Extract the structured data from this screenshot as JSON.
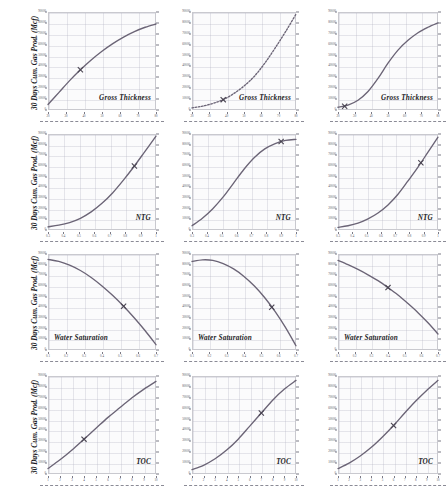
{
  "figure": {
    "shared_ylabel": "30 Days Cum. Gas Prod. (Mcf)",
    "rows": 4,
    "cols": 3,
    "curve_color": "#6b6476",
    "grid_color": "#b0b0c0",
    "marker": "x"
  },
  "chart_data": [
    {
      "id": "r1c1",
      "type": "line",
      "title": "",
      "xlabel": "Gross Thickness",
      "ylabel": "30 Days Cum. Gas Prod. (Mcf)",
      "annotation": "Gross Thickness",
      "shape": "concave-increasing",
      "grid": true,
      "xlim": [
        20,
        80
      ],
      "ylim": [
        0,
        90000
      ],
      "xticks": [
        20,
        30,
        40,
        50,
        60,
        70,
        80
      ],
      "yticks": [
        0,
        10000,
        20000,
        30000,
        40000,
        50000,
        60000,
        70000,
        80000,
        90000
      ],
      "xtick_labels": [
        "20",
        "30",
        "40",
        "50",
        "60",
        "70",
        "80"
      ],
      "ytick_labels": [
        "0",
        "10000",
        "20000",
        "30000",
        "40000",
        "50000",
        "60000",
        "70000",
        "80000",
        "90000"
      ],
      "x": [
        20,
        26,
        32,
        38,
        44,
        50,
        56,
        62,
        68,
        74,
        80
      ],
      "y": [
        5000,
        16000,
        27000,
        37000,
        46000,
        54000,
        61000,
        67000,
        72000,
        76000,
        79000
      ],
      "marker_point": [
        38,
        37000
      ]
    },
    {
      "id": "r1c2",
      "type": "line",
      "xlabel": "Gross Thickness",
      "ylabel": "30 Days Cum. Gas Prod. (Mcf)",
      "annotation": "Gross Thickness",
      "shape": "convex-increasing",
      "grid": true,
      "linestyle": "dotted",
      "xlim": [
        20,
        80
      ],
      "ylim": [
        0,
        90000
      ],
      "xticks": [
        20,
        30,
        40,
        50,
        60,
        70,
        80
      ],
      "yticks": [
        0,
        10000,
        20000,
        30000,
        40000,
        50000,
        60000,
        70000,
        80000,
        90000
      ],
      "xtick_labels": [
        "20",
        "30",
        "40",
        "50",
        "60",
        "70",
        "80"
      ],
      "ytick_labels": [
        "0",
        "10000",
        "20000",
        "30000",
        "40000",
        "50000",
        "60000",
        "70000",
        "80000",
        "90000"
      ],
      "x": [
        20,
        26,
        32,
        38,
        44,
        50,
        56,
        62,
        68,
        74,
        80
      ],
      "y": [
        2000,
        3500,
        6000,
        9500,
        15000,
        22000,
        31000,
        43000,
        57000,
        72000,
        88000
      ],
      "marker_point": [
        38,
        9500
      ]
    },
    {
      "id": "r1c3",
      "type": "line",
      "xlabel": "Gross Thickness",
      "ylabel": "30 Days Cum. Gas Prod. (Mcf)",
      "annotation": "Gross Thickness",
      "shape": "sigmoid-increasing",
      "grid": true,
      "xlim": [
        20,
        80
      ],
      "ylim": [
        0,
        90000
      ],
      "xticks": [
        20,
        30,
        40,
        50,
        60,
        70,
        80
      ],
      "yticks": [
        0,
        10000,
        20000,
        30000,
        40000,
        50000,
        60000,
        70000,
        80000,
        90000
      ],
      "xtick_labels": [
        "20",
        "30",
        "40",
        "50",
        "60",
        "70",
        "80"
      ],
      "ytick_labels": [
        "0",
        "10000",
        "20000",
        "30000",
        "40000",
        "50000",
        "60000",
        "70000",
        "80000",
        "90000"
      ],
      "x": [
        20,
        26,
        32,
        38,
        44,
        50,
        56,
        62,
        68,
        74,
        80
      ],
      "y": [
        2500,
        4500,
        9000,
        17000,
        29000,
        43000,
        55000,
        64000,
        71000,
        76000,
        80000
      ],
      "marker_point": [
        24,
        3500
      ]
    },
    {
      "id": "r2c1",
      "type": "line",
      "xlabel": "NTG",
      "ylabel": "30 Days Cum. Gas Prod. (Mcf)",
      "annotation": "NTG",
      "shape": "convex-increasing",
      "grid": true,
      "xlim": [
        0.3,
        1.0
      ],
      "ylim": [
        0,
        90000
      ],
      "xticks": [
        0.3,
        0.4,
        0.5,
        0.6,
        0.7,
        0.8,
        0.9,
        1.0
      ],
      "yticks": [
        0,
        10000,
        20000,
        30000,
        40000,
        50000,
        60000,
        70000,
        80000,
        90000
      ],
      "xtick_labels": [
        "0.3",
        "0.4",
        "0.5",
        "0.6",
        "0.7",
        "0.8",
        "0.9",
        "1"
      ],
      "ytick_labels": [
        "0",
        "10000",
        "20000",
        "30000",
        "40000",
        "50000",
        "60000",
        "70000",
        "80000",
        "90000"
      ],
      "x": [
        0.3,
        0.37,
        0.44,
        0.51,
        0.58,
        0.65,
        0.72,
        0.79,
        0.86,
        0.93,
        1.0
      ],
      "y": [
        3000,
        4500,
        7000,
        11000,
        17000,
        25000,
        35000,
        47000,
        60000,
        74000,
        88000
      ],
      "marker_point": [
        0.86,
        60000
      ]
    },
    {
      "id": "r2c2",
      "type": "line",
      "xlabel": "NTG",
      "ylabel": "30 Days Cum. Gas Prod. (Mcf)",
      "annotation": "NTG",
      "shape": "sigmoid-saturating",
      "grid": true,
      "xlim": [
        0.3,
        1.0
      ],
      "ylim": [
        0,
        90000
      ],
      "xticks": [
        0.3,
        0.4,
        0.5,
        0.6,
        0.7,
        0.8,
        0.9,
        1.0
      ],
      "yticks": [
        0,
        10000,
        20000,
        30000,
        40000,
        50000,
        60000,
        70000,
        80000,
        90000
      ],
      "xtick_labels": [
        "0.3",
        "0.4",
        "0.5",
        "0.6",
        "0.7",
        "0.8",
        "0.9",
        "1"
      ],
      "ytick_labels": [
        "0",
        "10000",
        "20000",
        "30000",
        "40000",
        "50000",
        "60000",
        "70000",
        "80000",
        "90000"
      ],
      "x": [
        0.3,
        0.37,
        0.44,
        0.51,
        0.58,
        0.65,
        0.72,
        0.79,
        0.86,
        0.93,
        1.0
      ],
      "y": [
        4000,
        11000,
        20000,
        31000,
        44000,
        57000,
        68000,
        76000,
        81000,
        84000,
        85000
      ],
      "marker_point": [
        0.9,
        83000
      ]
    },
    {
      "id": "r2c3",
      "type": "line",
      "xlabel": "NTG",
      "ylabel": "30 Days Cum. Gas Prod. (Mcf)",
      "annotation": "NTG",
      "shape": "convex-increasing",
      "grid": true,
      "xlim": [
        0.3,
        1.0
      ],
      "ylim": [
        0,
        90000
      ],
      "xticks": [
        0.3,
        0.4,
        0.5,
        0.6,
        0.7,
        0.8,
        0.9,
        1.0
      ],
      "yticks": [
        0,
        10000,
        20000,
        30000,
        40000,
        50000,
        60000,
        70000,
        80000,
        90000
      ],
      "xtick_labels": [
        "0.3",
        "0.4",
        "0.5",
        "0.6",
        "0.7",
        "0.8",
        "0.9",
        "1"
      ],
      "ytick_labels": [
        "0",
        "10000",
        "20000",
        "30000",
        "40000",
        "50000",
        "60000",
        "70000",
        "80000",
        "90000"
      ],
      "x": [
        0.3,
        0.37,
        0.44,
        0.51,
        0.58,
        0.65,
        0.72,
        0.79,
        0.86,
        0.93,
        1.0
      ],
      "y": [
        2500,
        4000,
        6500,
        10500,
        16000,
        23500,
        33500,
        46000,
        59000,
        73000,
        87000
      ],
      "marker_point": [
        0.88,
        63000
      ]
    },
    {
      "id": "r3c1",
      "type": "line",
      "xlabel": "Water Saturation",
      "ylabel": "30 Days Cum. Gas Prod. (Mcf)",
      "annotation": "Water Saturation",
      "shape": "concave-decreasing",
      "grid": true,
      "xlim": [
        0.1,
        0.7
      ],
      "ylim": [
        0,
        90000
      ],
      "xticks": [
        0.1,
        0.2,
        0.3,
        0.4,
        0.5,
        0.6,
        0.7
      ],
      "yticks": [
        0,
        10000,
        20000,
        30000,
        40000,
        50000,
        60000,
        70000,
        80000,
        90000
      ],
      "xtick_labels": [
        "0.1",
        "0.2",
        "0.3",
        "0.4",
        "0.5",
        "0.6",
        "0.7"
      ],
      "ytick_labels": [
        "0",
        "10000",
        "20000",
        "30000",
        "40000",
        "50000",
        "60000",
        "70000",
        "80000",
        "90000"
      ],
      "x": [
        0.1,
        0.16,
        0.22,
        0.28,
        0.34,
        0.4,
        0.46,
        0.52,
        0.58,
        0.64,
        0.7
      ],
      "y": [
        85000,
        83000,
        79500,
        74500,
        68000,
        60000,
        51000,
        41000,
        30000,
        18000,
        5000
      ],
      "marker_point": [
        0.52,
        41000
      ]
    },
    {
      "id": "r3c2",
      "type": "line",
      "xlabel": "Water Saturation",
      "ylabel": "30 Days Cum. Gas Prod. (Mcf)",
      "annotation": "Water Saturation",
      "shape": "peak-then-decreasing",
      "grid": true,
      "xlim": [
        0.1,
        0.7
      ],
      "ylim": [
        0,
        90000
      ],
      "xticks": [
        0.1,
        0.2,
        0.3,
        0.4,
        0.5,
        0.6,
        0.7
      ],
      "yticks": [
        0,
        10000,
        20000,
        30000,
        40000,
        50000,
        60000,
        70000,
        80000,
        90000
      ],
      "xtick_labels": [
        "0.1",
        "0.2",
        "0.3",
        "0.4",
        "0.5",
        "0.6",
        "0.7"
      ],
      "ytick_labels": [
        "0",
        "10000",
        "20000",
        "30000",
        "40000",
        "50000",
        "60000",
        "70000",
        "80000",
        "90000"
      ],
      "x": [
        0.1,
        0.16,
        0.22,
        0.28,
        0.34,
        0.4,
        0.46,
        0.52,
        0.58,
        0.64,
        0.7
      ],
      "y": [
        83000,
        84500,
        84000,
        81000,
        76000,
        69000,
        60000,
        49000,
        36000,
        21000,
        4000
      ],
      "marker_point": [
        0.56,
        40000
      ]
    },
    {
      "id": "r3c3",
      "type": "line",
      "xlabel": "Water Saturation",
      "ylabel": "30 Days Cum. Gas Prod. (Mcf)",
      "annotation": "Water Saturation",
      "shape": "concave-decreasing",
      "grid": true,
      "xlim": [
        0.1,
        0.7
      ],
      "ylim": [
        0,
        90000
      ],
      "xticks": [
        0.1,
        0.2,
        0.3,
        0.4,
        0.5,
        0.6,
        0.7
      ],
      "yticks": [
        0,
        10000,
        20000,
        30000,
        40000,
        50000,
        60000,
        70000,
        80000,
        90000
      ],
      "xtick_labels": [
        "0.1",
        "0.2",
        "0.3",
        "0.4",
        "0.5",
        "0.6",
        "0.7"
      ],
      "ytick_labels": [
        "0",
        "10000",
        "20000",
        "30000",
        "40000",
        "50000",
        "60000",
        "70000",
        "80000",
        "90000"
      ],
      "x": [
        0.1,
        0.16,
        0.22,
        0.28,
        0.34,
        0.4,
        0.46,
        0.52,
        0.58,
        0.64,
        0.7
      ],
      "y": [
        84000,
        80000,
        75500,
        70500,
        65000,
        58500,
        51500,
        43500,
        35000,
        25500,
        15000
      ],
      "marker_point": [
        0.4,
        58500
      ]
    },
    {
      "id": "r4c1",
      "type": "line",
      "xlabel": "TOC",
      "ylabel": "30 Days Cum. Gas Prod. (Mcf)",
      "annotation": "TOC",
      "shape": "slightly-convex-increasing",
      "grid": true,
      "xlim": [
        1,
        10
      ],
      "ylim": [
        0,
        90000
      ],
      "xticks": [
        1,
        2,
        3,
        4,
        5,
        6,
        7,
        8,
        9,
        10
      ],
      "yticks": [
        0,
        10000,
        20000,
        30000,
        40000,
        50000,
        60000,
        70000,
        80000,
        90000
      ],
      "xtick_labels": [
        "1",
        "2",
        "3",
        "4",
        "5",
        "6",
        "7",
        "8",
        "9",
        "10"
      ],
      "ytick_labels": [
        "0",
        "10000",
        "20000",
        "30000",
        "40000",
        "50000",
        "60000",
        "70000",
        "80000",
        "90000"
      ],
      "x": [
        1,
        2,
        3,
        4,
        5,
        6,
        7,
        8,
        9,
        10
      ],
      "y": [
        5000,
        13000,
        22000,
        32000,
        42000,
        52000,
        61000,
        70000,
        78000,
        85000
      ],
      "marker_point": [
        4,
        32000
      ]
    },
    {
      "id": "r4c2",
      "type": "line",
      "xlabel": "TOC",
      "ylabel": "30 Days Cum. Gas Prod. (Mcf)",
      "annotation": "TOC",
      "shape": "convex-increasing",
      "grid": true,
      "xlim": [
        1,
        10
      ],
      "ylim": [
        0,
        90000
      ],
      "xticks": [
        1,
        2,
        3,
        4,
        5,
        6,
        7,
        8,
        9,
        10
      ],
      "yticks": [
        0,
        10000,
        20000,
        30000,
        40000,
        50000,
        60000,
        70000,
        80000,
        90000
      ],
      "xtick_labels": [
        "1",
        "2",
        "3",
        "4",
        "5",
        "6",
        "7",
        "8",
        "9",
        "10"
      ],
      "ytick_labels": [
        "0",
        "10000",
        "20000",
        "30000",
        "40000",
        "50000",
        "60000",
        "70000",
        "80000",
        "90000"
      ],
      "x": [
        1,
        2,
        3,
        4,
        5,
        6,
        7,
        8,
        9,
        10
      ],
      "y": [
        4000,
        8000,
        14000,
        22000,
        32000,
        44000,
        56000,
        68000,
        78000,
        86000
      ],
      "marker_point": [
        7,
        56000
      ]
    },
    {
      "id": "r4c3",
      "type": "line",
      "xlabel": "TOC",
      "ylabel": "30 Days Cum. Gas Prod. (Mcf)",
      "annotation": "TOC",
      "shape": "convex-increasing",
      "grid": true,
      "xlim": [
        1,
        10
      ],
      "ylim": [
        0,
        90000
      ],
      "xticks": [
        1,
        2,
        3,
        4,
        5,
        6,
        7,
        8,
        9,
        10
      ],
      "yticks": [
        0,
        10000,
        20000,
        30000,
        40000,
        50000,
        60000,
        70000,
        80000,
        90000
      ],
      "xtick_labels": [
        "1",
        "2",
        "3",
        "4",
        "5",
        "6",
        "7",
        "8",
        "9",
        "10"
      ],
      "ytick_labels": [
        "0",
        "10000",
        "20000",
        "30000",
        "40000",
        "50000",
        "60000",
        "70000",
        "80000",
        "90000"
      ],
      "x": [
        1,
        2,
        3,
        4,
        5,
        6,
        7,
        8,
        9,
        10
      ],
      "y": [
        5000,
        10000,
        16500,
        24500,
        34000,
        44500,
        56000,
        67000,
        77000,
        86000
      ],
      "marker_point": [
        6,
        44500
      ]
    }
  ]
}
